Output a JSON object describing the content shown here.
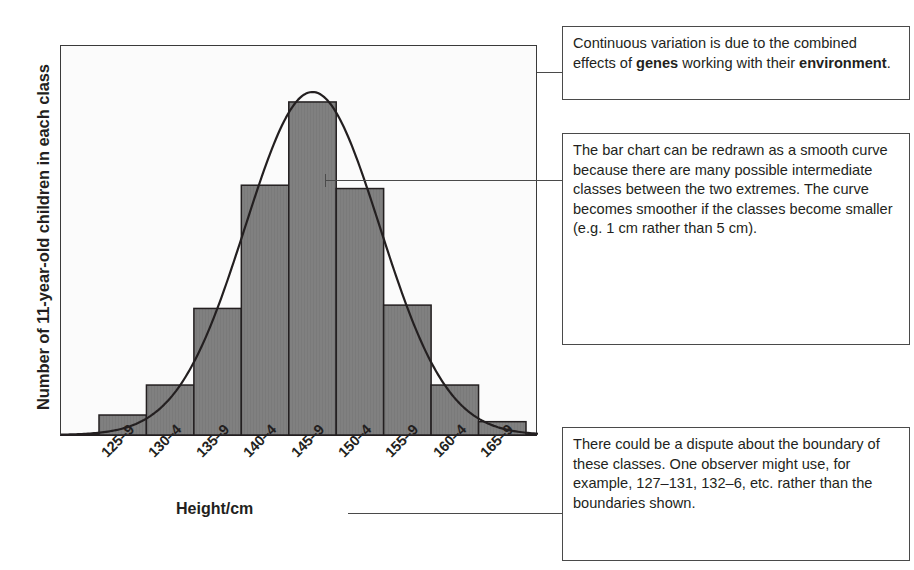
{
  "axes": {
    "ylabel": "Number of 11-year-old children in each class",
    "xlabel": "Height/cm"
  },
  "callouts": [
    {
      "id": "genes-environment",
      "text_parts": [
        {
          "text": "Continuous variation is due to the combined effects of ",
          "bold": false
        },
        {
          "text": "genes",
          "bold": true
        },
        {
          "text": " working with their ",
          "bold": false
        },
        {
          "text": "environment",
          "bold": true
        },
        {
          "text": ".",
          "bold": false
        }
      ],
      "plain": "Continuous variation is due to the combined effects of genes working with their environment."
    },
    {
      "id": "smooth-curve",
      "text_parts": [
        {
          "text": "The bar chart can be redrawn as a smooth curve because there are many possible intermediate classes between the two extremes. The curve becomes smoother if the classes become smaller (e.g. 1 cm rather than 5 cm).",
          "bold": false
        }
      ],
      "plain": "The bar chart can be redrawn as a smooth curve because there are many possible intermediate classes between the two extremes. The curve becomes smoother if the classes become smaller (e.g. 1 cm rather than 5 cm)."
    },
    {
      "id": "class-boundaries",
      "text_parts": [
        {
          "text": "There could be a dispute about the boundary of these classes. One observer might use, for example, 127–131, 132–6, etc. rather than the boundaries shown.",
          "bold": false
        }
      ],
      "plain": "There could be a dispute about the boundary of these classes. One observer might use, for example, 127–131, 132–6, etc. rather than the boundaries shown."
    }
  ],
  "colors": {
    "bar_fill": "#808080",
    "bar_stroke": "#231f20",
    "curve": "#231f20",
    "axis": "#231f20",
    "plot_background": "#fbfbfb",
    "box_border": "#4a4a4a",
    "text": "#231f20"
  },
  "chart_data": {
    "type": "bar",
    "title": "",
    "xlabel": "Height/cm",
    "ylabel": "Number of 11-year-old children in each class",
    "categories": [
      "125–9",
      "130–4",
      "135–9",
      "140–4",
      "145–9",
      "150–4",
      "155–9",
      "160–4",
      "165–9"
    ],
    "values": [
      6,
      15,
      38,
      75,
      100,
      74,
      39,
      15,
      4
    ],
    "ylim": [
      0,
      115
    ],
    "grid": false,
    "legend": null,
    "annotations": [
      "Continuous variation is due to the combined effects of genes working with their environment.",
      "The bar chart can be redrawn as a smooth curve because there are many possible intermediate classes between the two extremes. The curve becomes smoother if the classes become smaller (e.g. 1 cm rather than 5 cm).",
      "There could be a dispute about the boundary of these classes. One observer might use, for example, 127–131, 132–6, etc. rather than the boundaries shown."
    ],
    "overlay": {
      "type": "line",
      "name": "smooth normal curve",
      "mean_category_index": 4,
      "peak_value": 103,
      "sigma_in_categories": 1.42
    }
  }
}
